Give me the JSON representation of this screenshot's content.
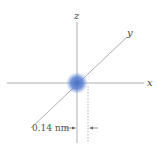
{
  "diagram": {
    "axes": {
      "x_label": "x",
      "y_label": "y",
      "z_label": "z"
    },
    "dimension_label": "0.14 nm",
    "cloud_color": "#4a6fc4",
    "axis_color": "#888888"
  }
}
